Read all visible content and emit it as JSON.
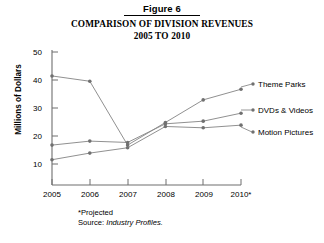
{
  "figure": {
    "label": "Figure 6",
    "title_line1": "COMPARISON OF DIVISION REVENUES",
    "title_line2": "2005 TO 2010"
  },
  "footnotes": {
    "projected": "*Projected",
    "source_prefix": "Source: ",
    "source_name": "Industry Profiles."
  },
  "chart_data": {
    "type": "line",
    "title": "COMPARISON OF DIVISION REVENUES 2005 TO 2010",
    "xlabel": "",
    "ylabel": "Millions of Dollars",
    "categories": [
      "2005",
      "2006",
      "2007",
      "2008",
      "2009",
      "2010*"
    ],
    "xtick_labels": [
      "2005",
      "2006",
      "2007",
      "2008",
      "2009",
      "2010*"
    ],
    "ytick_labels": [
      "10",
      "20",
      "30",
      "40",
      "50"
    ],
    "ytick_values": [
      10,
      20,
      30,
      40,
      50
    ],
    "ylim": [
      0,
      50
    ],
    "grid": false,
    "legend_position": "right-end-of-line",
    "series": [
      {
        "name": "Theme Parks",
        "values": [
          41,
          39,
          15,
          23.5,
          32,
          36
        ],
        "color": "#8a8a8a"
      },
      {
        "name": "DVDs & Videos",
        "values": [
          15,
          16.5,
          16,
          23,
          24,
          27
        ],
        "color": "#8a8a8a"
      },
      {
        "name": "Motion Pictures",
        "values": [
          9.5,
          12,
          14,
          22,
          21.5,
          22.5
        ],
        "color": "#8a8a8a"
      }
    ]
  },
  "colors": {
    "axis": "#6e6e6e",
    "line": "#8a8a8a",
    "marker": "#707070",
    "text": "#000000",
    "background": "#ffffff"
  }
}
